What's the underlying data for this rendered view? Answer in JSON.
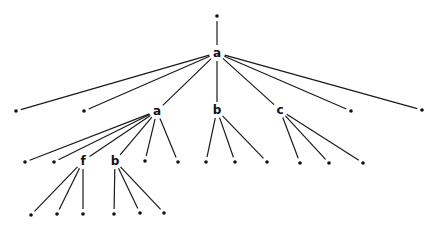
{
  "diagram": {
    "type": "tree",
    "title": "",
    "colors": {
      "edge": "#1a1a1a",
      "node": "#111111",
      "background": "#ffffff"
    },
    "nodes": [
      {
        "id": "n0",
        "label": "",
        "kind": "dot",
        "parent": null
      },
      {
        "id": "n1",
        "label": "a",
        "kind": "label",
        "parent": "n0"
      },
      {
        "id": "n2",
        "label": "",
        "kind": "dot",
        "parent": "n1"
      },
      {
        "id": "n3",
        "label": "",
        "kind": "dot",
        "parent": "n1"
      },
      {
        "id": "n4",
        "label": "a",
        "kind": "label",
        "parent": "n1"
      },
      {
        "id": "n5",
        "label": "b",
        "kind": "label",
        "parent": "n1"
      },
      {
        "id": "n6",
        "label": "c",
        "kind": "label",
        "parent": "n1"
      },
      {
        "id": "n7",
        "label": "",
        "kind": "dot",
        "parent": "n1"
      },
      {
        "id": "n8",
        "label": "",
        "kind": "dot",
        "parent": "n1"
      },
      {
        "id": "n9",
        "label": "",
        "kind": "dot",
        "parent": "n4"
      },
      {
        "id": "n10",
        "label": "",
        "kind": "dot",
        "parent": "n4"
      },
      {
        "id": "n11",
        "label": "f",
        "kind": "label",
        "parent": "n4"
      },
      {
        "id": "n12",
        "label": "b",
        "kind": "label",
        "parent": "n4"
      },
      {
        "id": "n13",
        "label": "",
        "kind": "dot",
        "parent": "n4"
      },
      {
        "id": "n14",
        "label": "",
        "kind": "dot",
        "parent": "n4"
      },
      {
        "id": "n15",
        "label": "",
        "kind": "dot",
        "parent": "n5"
      },
      {
        "id": "n16",
        "label": "",
        "kind": "dot",
        "parent": "n5"
      },
      {
        "id": "n17",
        "label": "",
        "kind": "dot",
        "parent": "n5"
      },
      {
        "id": "n18",
        "label": "",
        "kind": "dot",
        "parent": "n6"
      },
      {
        "id": "n19",
        "label": "",
        "kind": "dot",
        "parent": "n6"
      },
      {
        "id": "n20",
        "label": "",
        "kind": "dot",
        "parent": "n6"
      },
      {
        "id": "n21",
        "label": "",
        "kind": "dot",
        "parent": "n11"
      },
      {
        "id": "n22",
        "label": "",
        "kind": "dot",
        "parent": "n11"
      },
      {
        "id": "n23",
        "label": "",
        "kind": "dot",
        "parent": "n11"
      },
      {
        "id": "n24",
        "label": "",
        "kind": "dot",
        "parent": "n12"
      },
      {
        "id": "n25",
        "label": "",
        "kind": "dot",
        "parent": "n12"
      },
      {
        "id": "n26",
        "label": "",
        "kind": "dot",
        "parent": "n12"
      }
    ]
  }
}
